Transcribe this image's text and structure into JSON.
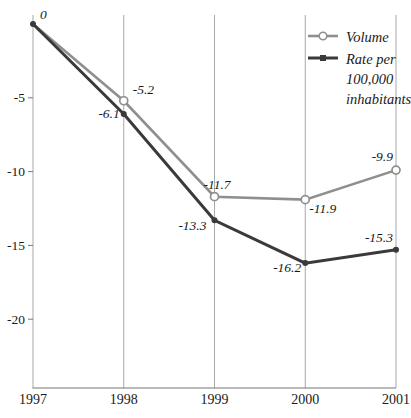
{
  "chart_data": {
    "type": "line",
    "x": [
      "1997",
      "1998",
      "1999",
      "2000",
      "2001"
    ],
    "series": [
      {
        "name": "Volume",
        "values": [
          0,
          -5.2,
          -11.7,
          -11.9,
          -9.9
        ],
        "point_labels": [
          "0",
          "-5.2",
          "-11.7",
          "-11.9",
          "-9.9"
        ],
        "color": "#8f8f8f",
        "marker": "open-circle"
      },
      {
        "name": "Rate per 100,000 inhabitants",
        "values": [
          0,
          -6.1,
          -13.3,
          -16.2,
          -15.3
        ],
        "point_labels": [
          "",
          "-6.1",
          "-13.3",
          "-16.2",
          "-15.3"
        ],
        "color": "#3a3a3a",
        "marker": "filled-square"
      }
    ],
    "yticks": [
      -5,
      -10,
      -15,
      -20
    ],
    "ytick_labels": [
      "-5",
      "-10",
      "-15",
      "-20"
    ],
    "ylim": [
      -22.5,
      0.8
    ],
    "grid": "vertical-only",
    "legend_position": "top-right"
  },
  "legend": {
    "volume_label": "Volume",
    "rate_lines": [
      "Rate per",
      "100,000",
      "inhabitants"
    ]
  },
  "colors": {
    "volume": "#8f8f8f",
    "rate": "#3a3a3a",
    "grid": "#a8a8a8",
    "axis": "#777777",
    "text": "#1a1a1a"
  }
}
